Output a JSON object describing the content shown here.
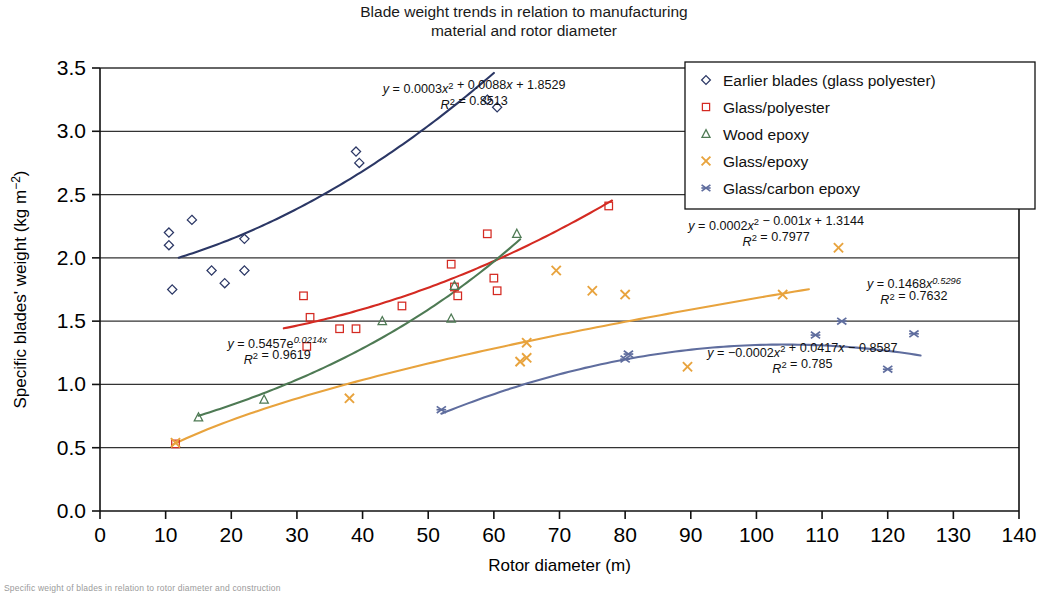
{
  "title_line1": "Blade weight trends in relation to manufacturing",
  "title_line2": "material and rotor diameter",
  "caption": "Specific weight of blades in relation to rotor diameter and construction",
  "axes": {
    "xlabel": "Rotor diameter (m)",
    "ylabel_main": "Specific blades' weight (kg m",
    "ylabel_exp": "−2",
    "ylabel_close": ")",
    "xticks": [
      "0",
      "10",
      "20",
      "30",
      "40",
      "50",
      "60",
      "70",
      "80",
      "90",
      "100",
      "110",
      "120",
      "130",
      "140"
    ],
    "yticks": [
      "0.0",
      "0.5",
      "1.0",
      "1.5",
      "2.0",
      "2.5",
      "3.0",
      "3.5"
    ],
    "xlim": [
      0,
      140
    ],
    "ylim": [
      0,
      3.5
    ],
    "grid": "horizontal"
  },
  "colors": {
    "earlier_blades": "#2b3765",
    "glass_polyester": "#d42a22",
    "wood_epoxy": "#4e7a54",
    "glass_epoxy": "#e8a33d",
    "glass_carbon_epoxy": "#5f6d9e",
    "axis": "#111111"
  },
  "legend": {
    "position": "top-right",
    "items": [
      {
        "label": "Earlier blades (glass polyester)",
        "marker": "diamond",
        "color_key": "earlier_blades"
      },
      {
        "label": "Glass/polyester",
        "marker": "square",
        "color_key": "glass_polyester"
      },
      {
        "label": "Wood epoxy",
        "marker": "triangle",
        "color_key": "wood_epoxy"
      },
      {
        "label": "Glass/epoxy",
        "marker": "cross",
        "color_key": "glass_epoxy"
      },
      {
        "label": "Glass/carbon epoxy",
        "marker": "asterisk",
        "color_key": "glass_carbon_epoxy"
      }
    ]
  },
  "annotations": [
    {
      "name": "eq-earlier-blades",
      "x": 57,
      "y": 3.3,
      "anchor": "middle",
      "color_key": "earlier_blades",
      "line1": "y = 0.0003x² + 0.0088x + 1.8529",
      "line2": "R² = 0.8513"
    },
    {
      "name": "eq-glass-polyester",
      "x": 103,
      "y": 2.22,
      "anchor": "middle",
      "color_key": "glass_polyester",
      "line1": "y = 0.0002x² − 0.001x + 1.3144",
      "line2": "R² = 0.7977"
    },
    {
      "name": "eq-glass-epoxy",
      "x": 124,
      "y": 1.76,
      "anchor": "middle",
      "color_key": "glass_epoxy",
      "line1": "y = 0.1468x^0.5296",
      "line2": "R² = 0.7632"
    },
    {
      "name": "eq-wood-epoxy",
      "x": 27,
      "y": 1.29,
      "anchor": "middle",
      "color_key": "wood_epoxy",
      "line1": "y = 0.5457e^0.0214x",
      "line2": "R² = 0.9619"
    },
    {
      "name": "eq-glass-carbon-epoxy",
      "x": 107,
      "y": 1.22,
      "anchor": "middle",
      "color_key": "glass_carbon_epoxy",
      "line1": "y = −0.0002x² + 0.0417x − 0.8587",
      "line2": "R² = 0.785"
    }
  ],
  "chart_data": {
    "type": "scatter",
    "title": "Blade weight trends in relation to manufacturing material and rotor diameter",
    "xlabel": "Rotor diameter (m)",
    "ylabel": "Specific blades' weight (kg m-2)",
    "xlim": [
      0,
      140
    ],
    "ylim": [
      0,
      3.5
    ],
    "series": [
      {
        "name": "Earlier blades (glass polyester)",
        "marker": "diamond",
        "color": "#2b3765",
        "points": [
          [
            10.5,
            2.2
          ],
          [
            10.5,
            2.1
          ],
          [
            11.0,
            1.75
          ],
          [
            14.0,
            2.3
          ],
          [
            17.0,
            1.9
          ],
          [
            19.0,
            1.8
          ],
          [
            22.0,
            1.9
          ],
          [
            22.0,
            2.15
          ],
          [
            39.0,
            2.84
          ],
          [
            39.5,
            2.75
          ],
          [
            59.0,
            3.25
          ],
          [
            60.5,
            3.19
          ]
        ],
        "trend": {
          "equation": "y = 0.0003x^2 + 0.0088x + 1.8529",
          "r2": 0.8513,
          "type": "quadratic",
          "coeffs": [
            0.0003,
            0.0088,
            1.8529
          ],
          "x_range": [
            12,
            60
          ]
        }
      },
      {
        "name": "Glass/polyester",
        "marker": "square",
        "color": "#d42a22",
        "points": [
          [
            11.5,
            0.53
          ],
          [
            31.0,
            1.7
          ],
          [
            31.5,
            1.3
          ],
          [
            32.0,
            1.53
          ],
          [
            36.5,
            1.44
          ],
          [
            39.0,
            1.44
          ],
          [
            46.0,
            1.62
          ],
          [
            53.5,
            1.95
          ],
          [
            54.0,
            1.77
          ],
          [
            54.5,
            1.7
          ],
          [
            59.0,
            2.19
          ],
          [
            60.0,
            1.84
          ],
          [
            60.5,
            1.74
          ],
          [
            77.5,
            2.41
          ]
        ],
        "trend": {
          "equation": "y = 0.0002x^2 - 0.001x + 1.3144",
          "r2": 0.7977,
          "type": "quadratic",
          "coeffs": [
            0.0002,
            -0.001,
            1.3144
          ],
          "x_range": [
            28,
            78
          ]
        }
      },
      {
        "name": "Wood epoxy",
        "marker": "triangle",
        "color": "#4e7a54",
        "points": [
          [
            15.0,
            0.74
          ],
          [
            25.0,
            0.88
          ],
          [
            43.0,
            1.5
          ],
          [
            53.5,
            1.52
          ],
          [
            54.0,
            1.78
          ],
          [
            63.5,
            2.19
          ]
        ],
        "trend": {
          "equation": "y = 0.5457e^(0.0214x)",
          "r2": 0.9619,
          "type": "exponential",
          "coeffs": [
            0.5457,
            0.0214
          ],
          "x_range": [
            15,
            64
          ]
        }
      },
      {
        "name": "Glass/epoxy",
        "marker": "cross",
        "color": "#e8a33d",
        "points": [
          [
            11.5,
            0.54
          ],
          [
            38.0,
            0.89
          ],
          [
            64.0,
            1.18
          ],
          [
            65.0,
            1.21
          ],
          [
            65.0,
            1.33
          ],
          [
            69.5,
            1.9
          ],
          [
            75.0,
            1.74
          ],
          [
            80.0,
            1.71
          ],
          [
            89.5,
            1.14
          ],
          [
            104.0,
            1.71
          ],
          [
            112.5,
            2.08
          ]
        ],
        "trend": {
          "equation": "y = 0.1468x^0.5296",
          "r2": 0.7632,
          "type": "power",
          "coeffs": [
            0.1468,
            0.5296
          ],
          "x_range": [
            11,
            108
          ]
        }
      },
      {
        "name": "Glass/carbon epoxy",
        "marker": "asterisk",
        "color": "#5f6d9e",
        "points": [
          [
            52.0,
            0.8
          ],
          [
            80.0,
            1.2
          ],
          [
            80.5,
            1.24
          ],
          [
            109.0,
            1.39
          ],
          [
            113.0,
            1.5
          ],
          [
            120.0,
            1.12
          ],
          [
            124.0,
            1.4
          ]
        ],
        "trend": {
          "equation": "y = -0.0002x^2 + 0.0417x - 0.8587",
          "r2": 0.785,
          "type": "quadratic",
          "coeffs": [
            -0.0002,
            0.0417,
            -0.8587
          ],
          "x_range": [
            52,
            125
          ]
        }
      }
    ]
  }
}
